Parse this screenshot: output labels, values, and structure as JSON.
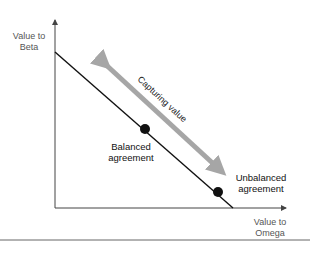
{
  "axes": {
    "y_label_line1": "Value to",
    "y_label_line2": "Beta",
    "x_label_line1": "Value to",
    "x_label_line2": "Omega"
  },
  "arrow": {
    "label": "Capturing value",
    "color": "#a6a6a6"
  },
  "points": [
    {
      "label_line1": "Balanced",
      "label_line2": "agreement"
    },
    {
      "label_line1": "Unbalanced",
      "label_line2": "agreement"
    }
  ],
  "colors": {
    "line": "#111111",
    "axis": "#444444",
    "rule": "#666666"
  }
}
